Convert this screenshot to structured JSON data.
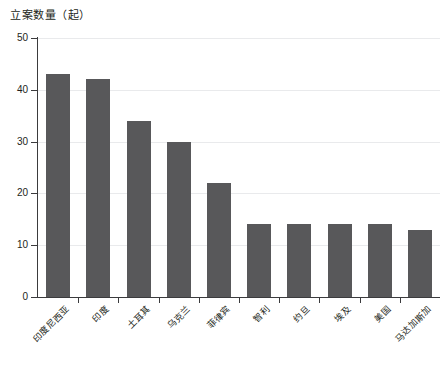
{
  "chart_data": {
    "type": "bar",
    "title": "立案数量（起）",
    "xlabel": "",
    "ylabel": "",
    "ylim": [
      0,
      50
    ],
    "yticks": [
      0,
      10,
      20,
      30,
      40,
      50
    ],
    "grid": true,
    "legend": "none",
    "bar_color": "#58585a",
    "grid_color": "#e9eaec",
    "axis_color": "#3b3b3d",
    "categories": [
      "印度尼西亚",
      "印度",
      "土耳其",
      "乌克兰",
      "菲律宾",
      "智利",
      "约旦",
      "埃及",
      "美国",
      "马达加斯加"
    ],
    "values": [
      43,
      42,
      34,
      30,
      22,
      14,
      14,
      14,
      14,
      13
    ]
  }
}
